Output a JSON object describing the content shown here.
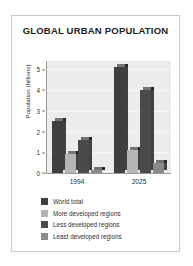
{
  "chart_data": {
    "type": "bar",
    "title": "GLOBAL URBAN POPULATION",
    "xlabel": "",
    "ylabel": "Population (billions)",
    "categories": [
      "1994",
      "2025"
    ],
    "ylim": [
      0,
      5.4
    ],
    "yticks": [
      "0",
      "1",
      "2",
      "3",
      "4",
      "5"
    ],
    "grid": true,
    "legend_position": "below",
    "series": [
      {
        "name": "World total",
        "color": "#3f3f3f",
        "values": [
          2.5,
          5.1
        ]
      },
      {
        "name": "More developed regions",
        "color": "#b5b5b5",
        "values": [
          0.9,
          1.1
        ]
      },
      {
        "name": "Less developed regions",
        "color": "#4a4a4a",
        "values": [
          1.6,
          4.0
        ]
      },
      {
        "name": "Least developed regions",
        "color": "#8a8a8a",
        "values": [
          0.15,
          0.5
        ]
      }
    ]
  },
  "figure": {
    "background": "#ffffff",
    "plot_background": "#ececec",
    "border_color": "#c9c9c9"
  }
}
